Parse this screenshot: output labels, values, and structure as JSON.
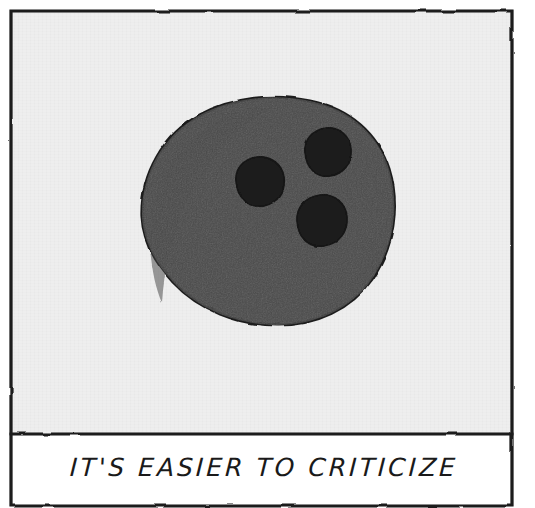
{
  "artwork": {
    "title": "bowling-ball-cartoon",
    "caption": "IT'S EASIER TO CRITICIZE",
    "panel": {
      "background_color": "#eeeeee",
      "caption_background_color": "#ffffff",
      "border_color": "#1a1a1a"
    },
    "subject": {
      "name": "bowling-ball",
      "fill_color": "#4a4a4a",
      "outline_color": "#1f1f1f",
      "hole_color": "#1c1c1c",
      "center_x": 262,
      "center_y": 207,
      "width": 240,
      "height": 213,
      "holes": [
        {
          "name": "finger-hole-left",
          "cx": 250,
          "cy": 172,
          "r": 24
        },
        {
          "name": "finger-hole-upper-right",
          "cx": 318,
          "cy": 143,
          "r": 23
        },
        {
          "name": "finger-hole-lower-right",
          "cx": 312,
          "cy": 212,
          "r": 25
        }
      ]
    }
  }
}
